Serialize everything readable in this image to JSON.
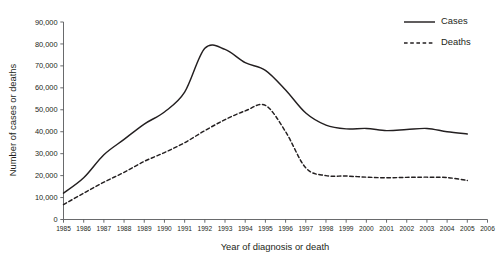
{
  "chart_data": {
    "type": "line",
    "title": "",
    "xlabel": "Year of diagnosis or death",
    "ylabel": "Number of cases or deaths",
    "x": [
      1985,
      1986,
      1987,
      1988,
      1989,
      1990,
      1991,
      1992,
      1993,
      1994,
      1995,
      1996,
      1997,
      1998,
      1999,
      2000,
      2001,
      2002,
      2003,
      2004,
      2005,
      2006
    ],
    "xticklabels": [
      "1985",
      "1986",
      "1987",
      "1988",
      "1989",
      "1990",
      "1991",
      "1992",
      "1993",
      "1994",
      "1995",
      "1996",
      "1997",
      "1998",
      "1999",
      "2000",
      "2001",
      "2002",
      "2003",
      "2004",
      "2005",
      "2006"
    ],
    "yticks": [
      0,
      10000,
      20000,
      30000,
      40000,
      50000,
      60000,
      70000,
      80000,
      90000
    ],
    "yticklabels": [
      "0",
      "10,000",
      "20,000",
      "30,000",
      "40,000",
      "50,000",
      "60,000",
      "70,000",
      "80,000",
      "90,000"
    ],
    "xlim": [
      1985,
      2006
    ],
    "ylim": [
      0,
      90000
    ],
    "grid": false,
    "legend_position": "top-right",
    "series": [
      {
        "name": "Cases",
        "style": "solid",
        "color": "#231f20",
        "values": [
          12000,
          19000,
          29500,
          36500,
          43500,
          49000,
          58000,
          78000,
          77500,
          71500,
          68000,
          59000,
          48500,
          43000,
          41300,
          41500,
          40500,
          41000,
          41500,
          40000,
          39000,
          null
        ]
      },
      {
        "name": "Deaths",
        "style": "dashed",
        "color": "#231f20",
        "values": [
          6800,
          12000,
          17000,
          21500,
          26500,
          30500,
          35000,
          40500,
          45500,
          49500,
          52000,
          40000,
          23500,
          20000,
          19800,
          19300,
          19000,
          19200,
          19300,
          19100,
          17800,
          null
        ]
      }
    ],
    "annotations": {
      "cases_plateau_peak_note": "Cases peak flat near 78,000 from 1992 to late 1992",
      "deaths_peak_note": "Deaths peak near 52,000 in late 1994 to early 1995"
    }
  },
  "legend": {
    "items": [
      {
        "label": "Cases",
        "style": "solid"
      },
      {
        "label": "Deaths",
        "style": "dashed"
      }
    ]
  },
  "axes": {
    "y_title": "Number of cases or deaths",
    "x_title": "Year of diagnosis or death"
  }
}
